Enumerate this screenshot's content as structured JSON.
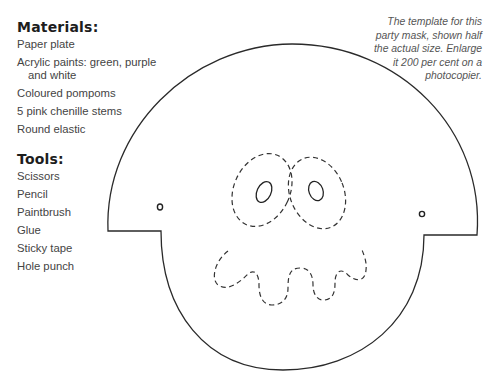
{
  "materials": {
    "heading": "Materials:",
    "items": [
      "Paper plate",
      "Acrylic paints: green, purple",
      "and white",
      "Coloured pompoms",
      "5 pink chenille stems",
      "Round elastic"
    ]
  },
  "tools": {
    "heading": "Tools:",
    "items": [
      "Scissors",
      "Pencil",
      "Paintbrush",
      "Glue",
      "Sticky tape",
      "Hole punch"
    ]
  },
  "caption": {
    "lines": [
      "The template for this",
      "party mask, shown half",
      "the actual size. Enlarge",
      "it 200 per cent on a",
      "photocopier."
    ]
  },
  "template": {
    "name": "party-mask-template",
    "outline_color": "#2a2a2a",
    "cut_line_style": "dashed"
  }
}
